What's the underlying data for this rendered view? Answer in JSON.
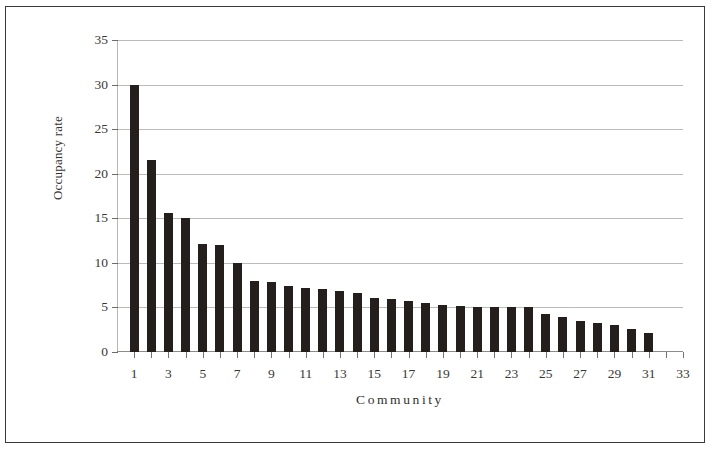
{
  "chart_data": {
    "type": "bar",
    "title": "",
    "xlabel": "Community",
    "ylabel": "Occupancy rate",
    "categories": [
      1,
      2,
      3,
      4,
      5,
      6,
      7,
      8,
      9,
      10,
      11,
      12,
      13,
      14,
      15,
      16,
      17,
      18,
      19,
      20,
      21,
      22,
      23,
      24,
      25,
      26,
      27,
      28,
      29,
      30,
      31,
      32
    ],
    "values": [
      30.0,
      21.5,
      15.6,
      15.0,
      12.1,
      12.0,
      10.0,
      8.0,
      7.8,
      7.4,
      7.2,
      7.1,
      6.8,
      6.6,
      6.1,
      5.9,
      5.7,
      5.5,
      5.3,
      5.2,
      5.1,
      5.1,
      5.1,
      5.0,
      4.3,
      3.9,
      3.5,
      3.2,
      3.0,
      2.6,
      2.1,
      0.0
    ],
    "bar_color": "#241f1d",
    "xlim": [
      0,
      33
    ],
    "ylim": [
      0,
      35
    ],
    "ytick_values": [
      0,
      5,
      10,
      15,
      20,
      25,
      30,
      35
    ],
    "ytick_labels": [
      "0",
      "5",
      "10",
      "15",
      "20",
      "25",
      "30",
      "35"
    ],
    "xtick_values": [
      1,
      3,
      5,
      7,
      9,
      11,
      13,
      15,
      17,
      19,
      21,
      23,
      25,
      27,
      29,
      31,
      33
    ],
    "xtick_labels": [
      "1",
      "3",
      "5",
      "7",
      "9",
      "11",
      "13",
      "15",
      "17",
      "19",
      "21",
      "23",
      "25",
      "27",
      "29",
      "31",
      "33"
    ],
    "grid": "horizontal",
    "legend": "none"
  }
}
